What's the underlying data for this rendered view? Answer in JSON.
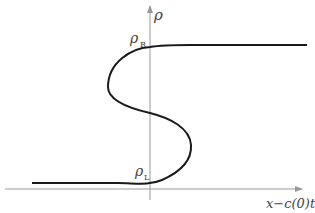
{
  "diagram": {
    "type": "s-shaped curve (multivalued profile)",
    "axes": {
      "vertical_label": "ρ",
      "horizontal_label": "x−c(0)t"
    },
    "labels": {
      "rho_R": {
        "symbol": "ρ",
        "subscript": "R"
      },
      "rho_L": {
        "symbol": "ρ",
        "subscript": "L"
      }
    },
    "colors": {
      "curve": "#1a1a1a",
      "axis": "#999999",
      "text": "#444444"
    }
  }
}
